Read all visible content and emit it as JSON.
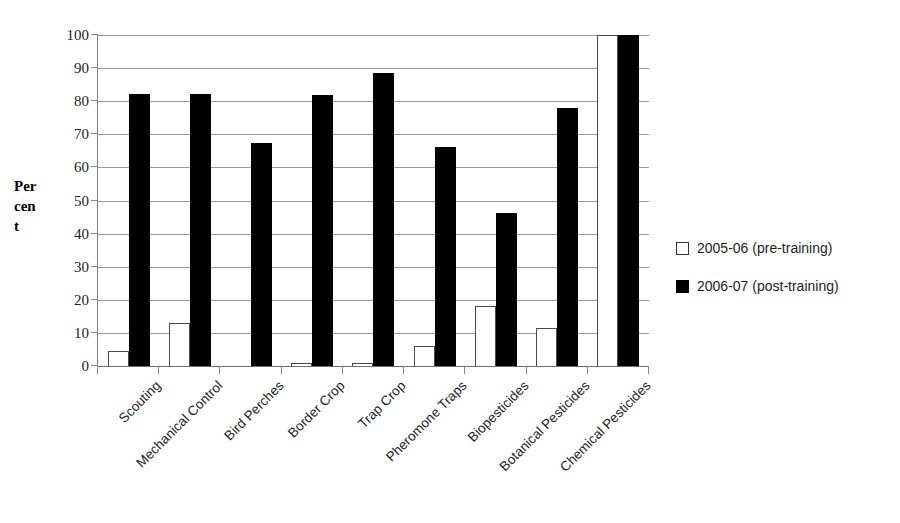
{
  "chart_data": {
    "type": "bar",
    "title": "",
    "subtitle": "",
    "xlabel": "",
    "ylabel": "Percent",
    "ylabel_wrapped": [
      "Per",
      "cen",
      "t"
    ],
    "ylim": [
      0,
      100
    ],
    "y_ticks": [
      0,
      10,
      20,
      30,
      40,
      50,
      60,
      70,
      80,
      90,
      100
    ],
    "grid": "horizontal",
    "legend_position": "right",
    "categories": [
      "Scouting",
      "Mechanical Control",
      "Bird Perches",
      "Border Crop",
      "Trap Crop",
      "Pheromone Traps",
      "Biopesticides",
      "Botanical Pesticides",
      "Chemical Pesticides"
    ],
    "series": [
      {
        "name": "2005-06 (pre-training)",
        "color": "#ffffff",
        "edge_color": "#4a4a4a",
        "values": [
          4.5,
          13,
          0,
          0.8,
          0.8,
          6,
          18,
          11.5,
          100
        ]
      },
      {
        "name": "2006-07 (post-training)",
        "color": "#000000",
        "edge_color": "#000000",
        "values": [
          82.3,
          82.3,
          67.5,
          81.8,
          88.4,
          66.2,
          46.2,
          77.8,
          100
        ]
      }
    ]
  },
  "legend": {
    "items": [
      {
        "label": "2005-06 (pre-training)",
        "swatch": "white-square"
      },
      {
        "label": "2006-07 (post-training)",
        "swatch": "black-square"
      }
    ]
  },
  "colors": {
    "pre_training_fill": "#ffffff",
    "post_training_fill": "#000000",
    "gridline": "#9a9a9a",
    "axis": "#7c7c7c",
    "background": "#ffffff",
    "text": "#1d1d1d"
  }
}
